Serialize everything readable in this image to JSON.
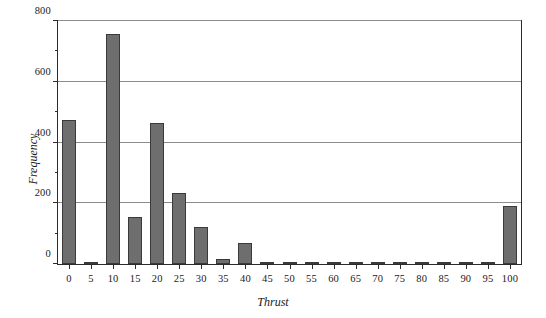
{
  "chart_data": {
    "type": "bar",
    "title": "",
    "xlabel": "Thrust",
    "ylabel": "Frequency",
    "categories": [
      "0",
      "5",
      "10",
      "15",
      "20",
      "25",
      "30",
      "35",
      "40",
      "45",
      "50",
      "55",
      "60",
      "65",
      "70",
      "75",
      "80",
      "85",
      "90",
      "95",
      "100"
    ],
    "values": [
      470,
      8,
      750,
      155,
      462,
      232,
      122,
      15,
      67,
      3,
      3,
      3,
      3,
      3,
      3,
      3,
      3,
      3,
      3,
      3,
      188
    ],
    "xlim": [
      -2.5,
      102.5
    ],
    "ylim": [
      0,
      800
    ],
    "yticks": [
      0,
      200,
      400,
      600,
      800
    ],
    "ytick_labels": [
      "0",
      "200",
      "400",
      "600",
      "800"
    ],
    "yminor_ticks": [
      100,
      300,
      500,
      700
    ],
    "grid": "horizontal",
    "legend": "none",
    "bar_color": "#6e6e6e",
    "bar_edge_color": "#3a3a3a",
    "gridline_color": "#8c8c8c",
    "axis_color": "#2b2b2b"
  }
}
